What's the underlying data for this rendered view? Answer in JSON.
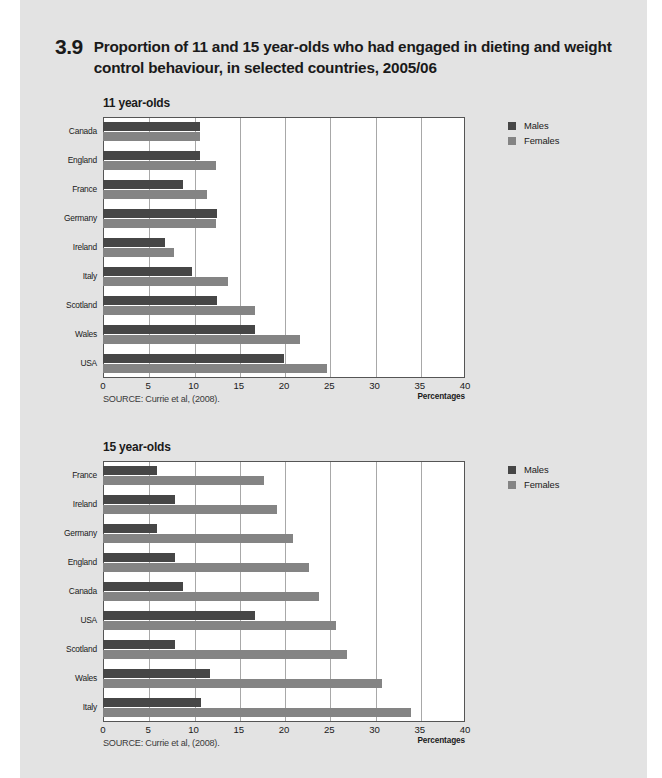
{
  "figure": {
    "number": "3.9",
    "title": "Proportion of 11 and 15 year-olds who had engaged in dieting and weight control behaviour, in selected countries, 2005/06"
  },
  "legend": {
    "males_label": "Males",
    "females_label": "Females",
    "male_color": "#464646",
    "female_color": "#848484"
  },
  "axis": {
    "title": "Percentages",
    "ticks": [
      "0",
      "5",
      "10",
      "15",
      "20",
      "25",
      "30",
      "35",
      "40"
    ]
  },
  "source": "SOURCE: Currie et al, (2008).",
  "charts": [
    {
      "subtitle": "11 year-olds",
      "source": "SOURCE: Currie et al, (2008)."
    },
    {
      "subtitle": "15 year-olds",
      "source": "SOURCE: Currie et al, (2008)."
    }
  ],
  "chart_data": [
    {
      "type": "bar",
      "orientation": "horizontal",
      "title": "11 year-olds",
      "xlabel": "Percentages",
      "ylabel": "",
      "xlim": [
        0,
        40
      ],
      "xticks": [
        0,
        5,
        10,
        15,
        20,
        25,
        30,
        35,
        40
      ],
      "grid": true,
      "legend_position": "right",
      "categories": [
        "Canada",
        "England",
        "France",
        "Germany",
        "Ireland",
        "Italy",
        "Scotland",
        "Wales",
        "USA"
      ],
      "series": [
        {
          "name": "Males",
          "values": [
            10.7,
            10.7,
            8.8,
            12.6,
            6.8,
            9.8,
            12.6,
            16.8,
            20.0
          ]
        },
        {
          "name": "Females",
          "values": [
            10.7,
            12.5,
            11.5,
            12.5,
            7.8,
            13.8,
            16.8,
            21.8,
            24.8
          ]
        }
      ]
    },
    {
      "type": "bar",
      "orientation": "horizontal",
      "title": "15 year-olds",
      "xlabel": "Percentages",
      "ylabel": "",
      "xlim": [
        0,
        40
      ],
      "xticks": [
        0,
        5,
        10,
        15,
        20,
        25,
        30,
        35,
        40
      ],
      "grid": true,
      "legend_position": "right",
      "categories": [
        "France",
        "Ireland",
        "Germany",
        "England",
        "Canada",
        "USA",
        "Scotland",
        "Wales",
        "Italy"
      ],
      "series": [
        {
          "name": "Males",
          "values": [
            6.0,
            8.0,
            6.0,
            8.0,
            8.8,
            16.8,
            8.0,
            11.8,
            10.8
          ]
        },
        {
          "name": "Females",
          "values": [
            17.8,
            19.2,
            21.0,
            22.8,
            23.9,
            25.8,
            27.0,
            30.8,
            34.0
          ]
        }
      ]
    }
  ]
}
